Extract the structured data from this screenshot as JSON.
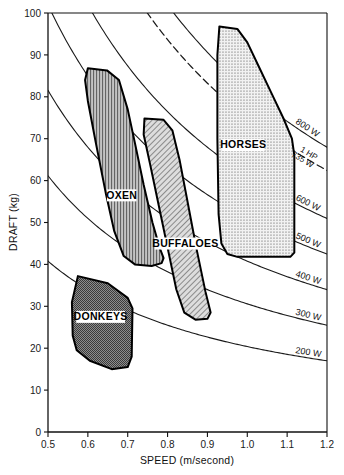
{
  "chart_data": {
    "type": "line",
    "title": "",
    "xlabel": "SPEED (m/second)",
    "ylabel": "DRAFT (kg)",
    "xlim": [
      0.5,
      1.2
    ],
    "ylim": [
      0,
      100
    ],
    "xticks": [
      "0.5",
      "0.6",
      "0.7",
      "0.8",
      "0.9",
      "1.0",
      "1.1",
      "1.2"
    ],
    "xtick_values": [
      0.5,
      0.6,
      0.7,
      0.8,
      0.9,
      1.0,
      1.1,
      1.2
    ],
    "yticks": [
      "0",
      "10",
      "20",
      "30",
      "40",
      "50",
      "60",
      "70",
      "80",
      "90",
      "100"
    ],
    "ytick_values": [
      0,
      10,
      20,
      30,
      40,
      50,
      60,
      70,
      80,
      90,
      100
    ],
    "grid": false,
    "legend_position": "inline-right",
    "series": [
      {
        "name": "200 W",
        "label": "200 W",
        "power_watts": 200,
        "dashed": false,
        "values_at_xticks": [
          40.8,
          34.0,
          29.1,
          25.5,
          22.7,
          20.4,
          18.5,
          17.0
        ]
      },
      {
        "name": "300 W",
        "label": "300 W",
        "power_watts": 300,
        "dashed": false,
        "values_at_xticks": [
          61.2,
          51.0,
          43.7,
          38.2,
          34.0,
          30.6,
          27.8,
          25.5
        ]
      },
      {
        "name": "400 W",
        "label": "400 W",
        "power_watts": 400,
        "dashed": false,
        "values_at_xticks": [
          81.6,
          68.0,
          58.3,
          51.0,
          45.3,
          40.8,
          37.1,
          34.0
        ]
      },
      {
        "name": "500 W",
        "label": "500 W",
        "power_watts": 500,
        "dashed": false,
        "values_at_xticks": [
          101.9,
          85.0,
          72.8,
          63.7,
          56.6,
          51.0,
          46.3,
          42.5
        ]
      },
      {
        "name": "600 W",
        "label": "600 W",
        "power_watts": 600,
        "dashed": false,
        "values_at_xticks": [
          122.3,
          102.0,
          87.4,
          76.5,
          68.0,
          61.2,
          55.6,
          51.0
        ]
      },
      {
        "name": "735 W",
        "label": "1 HP",
        "label2": "735 W",
        "power_watts": 735,
        "dashed": true,
        "values_at_xticks": [
          149.8,
          124.9,
          107.0,
          93.7,
          83.3,
          74.9,
          68.1,
          62.4
        ]
      },
      {
        "name": "800 W",
        "label": "800 W",
        "power_watts": 800,
        "dashed": false,
        "values_at_xticks": [
          163.1,
          135.9,
          116.5,
          101.9,
          90.6,
          81.6,
          74.1,
          68.0
        ]
      }
    ],
    "regions": [
      {
        "name": "OXEN",
        "label": "OXEN",
        "fill": "vertical-hatch",
        "label_x": 0.685,
        "label_y": 56,
        "speed_range": [
          0.575,
          0.795
        ],
        "draft_range": [
          41,
          87
        ],
        "outline": [
          [
            0.6,
            86.8
          ],
          [
            0.648,
            86.3
          ],
          [
            0.678,
            84.0
          ],
          [
            0.7,
            77.0
          ],
          [
            0.718,
            69.0
          ],
          [
            0.74,
            59.0
          ],
          [
            0.762,
            50.0
          ],
          [
            0.78,
            44.0
          ],
          [
            0.79,
            41.5
          ],
          [
            0.785,
            40.3
          ],
          [
            0.76,
            39.6
          ],
          [
            0.718,
            40.0
          ],
          [
            0.69,
            42.0
          ],
          [
            0.666,
            48.0
          ],
          [
            0.645,
            57.0
          ],
          [
            0.62,
            69.0
          ],
          [
            0.6,
            79.0
          ],
          [
            0.593,
            84.0
          ]
        ]
      },
      {
        "name": "BUFFALOES",
        "label": "BUFFALOES",
        "fill": "diagonal-hatch",
        "label_x": 0.845,
        "label_y": 44.5,
        "speed_range": [
          0.718,
          0.912
        ],
        "draft_range": [
          27,
          75
        ],
        "outline": [
          [
            0.742,
            74.8
          ],
          [
            0.79,
            74.5
          ],
          [
            0.812,
            72.0
          ],
          [
            0.83,
            65.0
          ],
          [
            0.85,
            55.0
          ],
          [
            0.872,
            44.0
          ],
          [
            0.895,
            33.5
          ],
          [
            0.908,
            28.5
          ],
          [
            0.9,
            27.0
          ],
          [
            0.87,
            26.8
          ],
          [
            0.842,
            28.5
          ],
          [
            0.822,
            34.0
          ],
          [
            0.8,
            44.0
          ],
          [
            0.778,
            54.0
          ],
          [
            0.756,
            64.0
          ],
          [
            0.74,
            71.0
          ]
        ]
      },
      {
        "name": "HORSES",
        "label": "HORSES",
        "fill": "dotted",
        "label_x": 0.99,
        "label_y": 68,
        "speed_range": [
          0.905,
          1.118
        ],
        "draft_range": [
          42,
          97
        ],
        "outline": [
          [
            0.93,
            96.8
          ],
          [
            0.975,
            96.2
          ],
          [
            1.0,
            93.0
          ],
          [
            1.03,
            87.0
          ],
          [
            1.06,
            81.0
          ],
          [
            1.09,
            75.0
          ],
          [
            1.112,
            70.0
          ],
          [
            1.118,
            66.0
          ],
          [
            1.118,
            42.8
          ],
          [
            1.108,
            41.8
          ],
          [
            0.975,
            41.8
          ],
          [
            0.95,
            42.5
          ],
          [
            0.935,
            45.0
          ],
          [
            0.928,
            52.0
          ],
          [
            0.925,
            70.0
          ],
          [
            0.925,
            90.0
          ]
        ]
      },
      {
        "name": "DONKEYS",
        "label": "DONKEYS",
        "fill": "fine-crosshatch",
        "label_x": 0.632,
        "label_y": 27,
        "speed_range": [
          0.558,
          0.712
        ],
        "draft_range": [
          15,
          37.5
        ],
        "outline": [
          [
            0.575,
            37.2
          ],
          [
            0.65,
            35.5
          ],
          [
            0.7,
            32.0
          ],
          [
            0.712,
            29.5
          ],
          [
            0.71,
            18.0
          ],
          [
            0.7,
            15.5
          ],
          [
            0.66,
            15.0
          ],
          [
            0.605,
            17.0
          ],
          [
            0.572,
            19.5
          ],
          [
            0.562,
            23.0
          ],
          [
            0.56,
            31.0
          ]
        ]
      }
    ]
  },
  "colors": {
    "axis": "#111111",
    "curve": "#1a1a1a",
    "region_outline": "#000000",
    "oxen_fill": "#b9b9b9",
    "buffaloes_fill": "#c9c9c9",
    "horses_fill": "#e2e2e2",
    "donkeys_fill": "#8f8f8f",
    "background": "#ffffff"
  }
}
